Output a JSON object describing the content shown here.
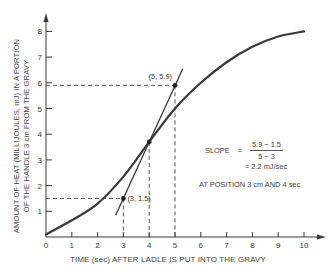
{
  "chart_data": {
    "type": "line",
    "title": "",
    "xlabel": "TIME (sec) AFTER LADLE IS PUT INTO THE GRAVY",
    "ylabel_line1": "AMOUNT OF HEAT (MILLIJOULES, mJ) IN A PORTION",
    "ylabel_line2": "OF THE HANDLE 3 cm FROM THE GRAVY",
    "xlim": [
      0,
      10.5
    ],
    "ylim": [
      0,
      8.5
    ],
    "x_ticks": [
      "0",
      "1",
      "2",
      "3",
      "4",
      "5",
      "6",
      "7",
      "8",
      "9",
      "10"
    ],
    "y_ticks": [
      "1",
      "2",
      "3",
      "4",
      "5",
      "6",
      "7",
      "8"
    ],
    "grid": false,
    "series": [
      {
        "name": "Heat curve",
        "x": [
          0,
          1,
          2,
          3,
          4,
          5,
          6,
          7,
          8,
          9,
          10
        ],
        "values": [
          0.1,
          0.65,
          1.3,
          2.35,
          3.7,
          5.0,
          6.0,
          6.8,
          7.4,
          7.8,
          8.0
        ]
      },
      {
        "name": "Tangent at t=4",
        "x": [
          2.7,
          5.3
        ],
        "values": [
          0.85,
          6.55
        ]
      }
    ],
    "points": [
      {
        "label": "(3, 1.5)",
        "x": 3,
        "y": 1.5
      },
      {
        "label": "",
        "x": 4,
        "y": 3.7
      },
      {
        "label": "(5, 5.9)",
        "x": 5,
        "y": 5.9
      }
    ],
    "annotations": {
      "slope_label": "SLOPE",
      "equals": "=",
      "numerator": "5.9 − 1.5",
      "denominator": "5 − 3",
      "result": "= 2.2 mJ/sec",
      "position_note": "AT POSITION 3 cm AND 4 sec"
    }
  }
}
